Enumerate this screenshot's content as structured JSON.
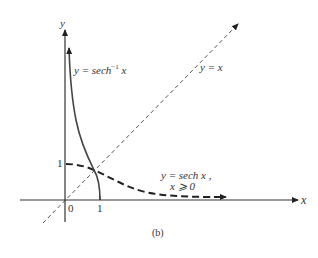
{
  "figure": {
    "caption": "(b)",
    "axes": {
      "x_label": "x",
      "y_label": "y",
      "origin_label": "0",
      "x_tick_label": "1",
      "y_tick_label": "1"
    },
    "curves": [
      {
        "id": "sech-inverse",
        "label_prefix": "y = sech",
        "label_sup": "−1",
        "label_suffix": " x",
        "style": "solid"
      },
      {
        "id": "identity",
        "label": "y = x",
        "style": "thin-dashed"
      },
      {
        "id": "sech",
        "label_line1": "y = sech x ,",
        "label_line2": "x ⩾ 0",
        "style": "thick-dashed"
      }
    ]
  }
}
